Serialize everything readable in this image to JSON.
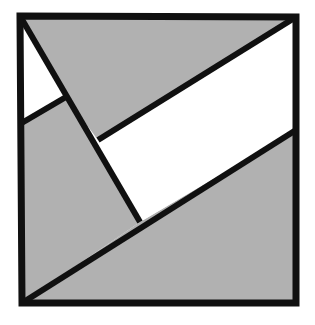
{
  "figure": {
    "type": "geometric-line-diagram",
    "canvas": {
      "width": 315,
      "height": 325
    },
    "colors": {
      "background": "#ffffff",
      "fill_gray": "#b1b1b1",
      "fill_white": "#ffffff",
      "stroke": "#101010"
    },
    "stroke_widths": {
      "border": 7,
      "interior": 6
    },
    "square_corners": {
      "top_left": [
        20,
        16
      ],
      "top_right": [
        296,
        17
      ],
      "bottom_right": [
        296,
        303
      ],
      "bottom_left": [
        22,
        303
      ]
    },
    "vertices": {
      "A_top_left": [
        20,
        16
      ],
      "B_top_right": [
        296,
        17
      ],
      "C_bottom_right": [
        296,
        303
      ],
      "D_bottom_left": [
        22,
        303
      ],
      "E_left_edge_mid": [
        20,
        124
      ],
      "F_diagonal_junction": [
        66,
        97
      ],
      "G_parallelogram_left": [
        98,
        140
      ],
      "H_parallelogram_bottom": [
        140,
        222
      ],
      "I_right_edge_mid": [
        296,
        130
      ]
    },
    "regions": [
      {
        "name": "upper-left-white-triangle",
        "fill": "white",
        "points": "20,16 66,97 20,124"
      },
      {
        "name": "upper-gray-wedge",
        "fill": "gray",
        "points": "20,16 296,17 98,140 66,97"
      },
      {
        "name": "left-gray-body",
        "fill": "gray",
        "points": "20,124 66,97 140,222 22,303"
      },
      {
        "name": "white-parallelogram-band",
        "fill": "white",
        "points": "98,140 296,17 296,130 140,222"
      },
      {
        "name": "lower-right-gray-triangle",
        "fill": "gray",
        "points": "140,222 296,130 296,303 22,303"
      }
    ],
    "segments": [
      {
        "name": "square-top-edge",
        "from": [
          20,
          16
        ],
        "to": [
          296,
          17
        ]
      },
      {
        "name": "square-right-edge",
        "from": [
          296,
          17
        ],
        "to": [
          296,
          303
        ]
      },
      {
        "name": "square-bottom-edge",
        "from": [
          296,
          303
        ],
        "to": [
          22,
          303
        ]
      },
      {
        "name": "square-left-edge",
        "from": [
          22,
          303
        ],
        "to": [
          20,
          16
        ]
      },
      {
        "name": "steep-main-diagonal",
        "from": [
          20,
          16
        ],
        "to": [
          140,
          222
        ]
      },
      {
        "name": "short-upper-left-cut",
        "from": [
          20,
          124
        ],
        "to": [
          66,
          97
        ]
      },
      {
        "name": "parallelogram-upper-edge",
        "from": [
          98,
          140
        ],
        "to": [
          296,
          17
        ]
      },
      {
        "name": "long-lower-diagonal",
        "from": [
          22,
          303
        ],
        "to": [
          296,
          130
        ]
      }
    ]
  }
}
